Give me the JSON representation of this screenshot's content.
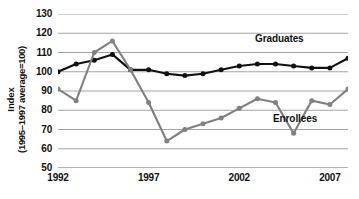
{
  "axes": {
    "y_title_main": "Index",
    "y_title_sub": "(1995–1997 average=100)",
    "y_ticks": [
      "130",
      "120",
      "110",
      "100",
      "90",
      "80",
      "70",
      "60",
      "50"
    ],
    "x_ticks": [
      "1992",
      "1997",
      "2002",
      "2007"
    ]
  },
  "labels": {
    "graduates": "Graduates",
    "enrollees": "Enrollees"
  },
  "colors": {
    "graduates_line": "#111111",
    "enrollees_line": "#808080",
    "gridline": "#9a9a9a",
    "background": "#ffffff"
  },
  "chart_data": {
    "type": "line",
    "title": "",
    "xlabel": "",
    "ylabel": "Index (1995–1997 average=100)",
    "xlim": [
      1992,
      2008
    ],
    "ylim": [
      50,
      130
    ],
    "ytick_values": [
      50,
      60,
      70,
      80,
      90,
      100,
      110,
      120,
      130
    ],
    "xtick_values": [
      1992,
      1997,
      2002,
      2007
    ],
    "grid": true,
    "legend": "inline-labels",
    "x": [
      1992,
      1993,
      1994,
      1995,
      1996,
      1997,
      1998,
      1999,
      2000,
      2001,
      2002,
      2003,
      2004,
      2005,
      2006,
      2007,
      2008
    ],
    "series": [
      {
        "name": "Graduates",
        "color": "#111111",
        "marker": "circle",
        "values": [
          100,
          104,
          106,
          109,
          101,
          101,
          99,
          98,
          99,
          101,
          103,
          104,
          104,
          103,
          102,
          102,
          107
        ]
      },
      {
        "name": "Enrollees",
        "color": "#808080",
        "marker": "circle",
        "values": [
          91,
          85,
          110,
          116,
          101,
          84,
          64,
          70,
          73,
          76,
          81,
          86,
          84,
          68,
          85,
          83,
          91
        ]
      }
    ]
  }
}
